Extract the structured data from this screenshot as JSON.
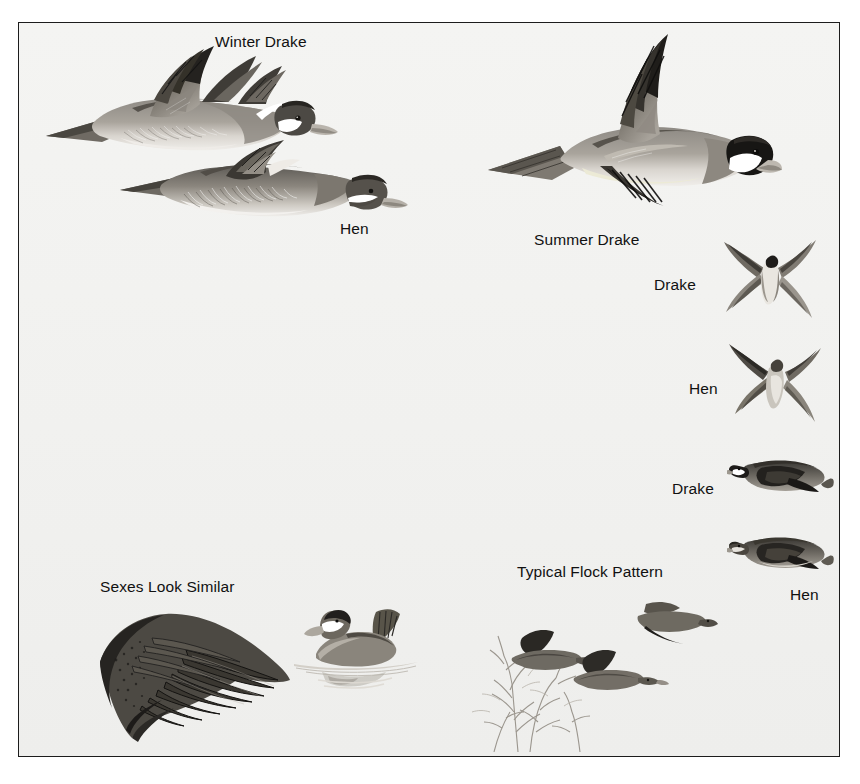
{
  "plate": {
    "species": "Ruddy Duck",
    "background_color": "#f2f2f0",
    "border_color": "#1c1c1c",
    "text_color": "#111111"
  },
  "labels": {
    "winter_drake": "Winter Drake",
    "hen_flight_left": "Hen",
    "summer_drake": "Summer Drake",
    "drake_overhead": "Drake",
    "hen_overhead": "Hen",
    "drake_side": "Drake",
    "hen_side": "Hen",
    "sexes_look_similar": "Sexes Look Similar",
    "typical_flock_pattern": "Typical Flock Pattern"
  },
  "figures": {
    "winter_drake": "flying-duck-winter-drake",
    "hen_flight": "flying-duck-hen",
    "summer_drake": "flying-duck-summer-drake",
    "drake_overhead": "overhead-duck-drake",
    "hen_overhead": "overhead-duck-hen",
    "drake_side": "side-flying-duck-drake",
    "hen_side": "side-flying-duck-hen",
    "wing_detail": "duck-wing-detail",
    "swimming_duck": "swimming-duck",
    "flock": "flock-of-ducks-over-brush"
  }
}
